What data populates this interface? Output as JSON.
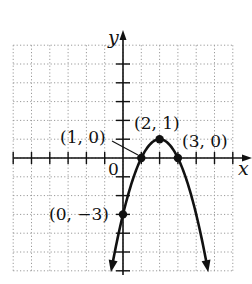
{
  "chart_data": {
    "type": "line",
    "title": "",
    "xlabel": "x",
    "ylabel": "y",
    "xlim": [
      -6,
      6
    ],
    "ylim": [
      -6,
      6
    ],
    "grid": true,
    "grid_style": "dotted",
    "function": "y = -(x - 2)^2 + 1",
    "origin_label": "0",
    "series": [
      {
        "name": "parabola",
        "x": [
          -0.6,
          0,
          1,
          2,
          3,
          4,
          4.6
        ],
        "y": [
          -5.76,
          -3,
          0,
          1,
          0,
          -3,
          -5.76
        ]
      }
    ],
    "points": [
      {
        "x": 1,
        "y": 0,
        "label": "(1, 0)"
      },
      {
        "x": 2,
        "y": 1,
        "label": "(2, 1)"
      },
      {
        "x": 3,
        "y": 0,
        "label": "(3, 0)"
      },
      {
        "x": 0,
        "y": -3,
        "label": "(0, −3)"
      }
    ]
  },
  "colors": {
    "curve": "#111111",
    "axis": "#111111",
    "grid": "#9a9a9a"
  }
}
